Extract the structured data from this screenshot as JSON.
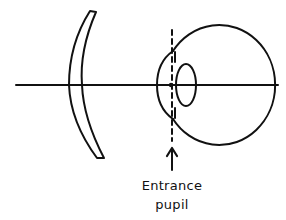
{
  "diagram": {
    "type": "optics schematic",
    "elements": [
      {
        "id": "optical-axis",
        "kind": "line",
        "description": "horizontal optical axis"
      },
      {
        "id": "spectacle-lens",
        "kind": "meniscus lens"
      },
      {
        "id": "eye-globe",
        "kind": "circle"
      },
      {
        "id": "cornea",
        "kind": "arc"
      },
      {
        "id": "crystalline-lens",
        "kind": "ellipse"
      },
      {
        "id": "entrance-pupil-plane",
        "kind": "dashed vertical line"
      },
      {
        "id": "entrance-pupil-arrow",
        "kind": "arrow",
        "points_to": "entrance-pupil-plane"
      }
    ],
    "colors": {
      "stroke": "#111111",
      "background": "#ffffff"
    }
  },
  "labels": {
    "entrance_line1": "Entrance",
    "entrance_line2": "pupil"
  }
}
